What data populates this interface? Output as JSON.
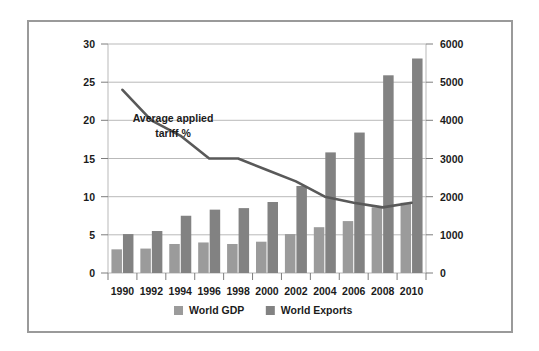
{
  "chart_data": {
    "type": "bar",
    "title": "",
    "subtitle": "",
    "xlabel": "",
    "ylabel": "",
    "categories": [
      "1990",
      "1992",
      "1994",
      "1996",
      "1998",
      "2000",
      "2002",
      "2004",
      "2006",
      "2008",
      "2010"
    ],
    "grid": true,
    "legend_position": "bottom",
    "left_axis": {
      "label": "",
      "ticks": [
        "0",
        "5",
        "10",
        "15",
        "20",
        "25",
        "30"
      ],
      "tick_values": [
        0,
        5,
        10,
        15,
        20,
        25,
        30
      ],
      "ylim": [
        0,
        30
      ]
    },
    "right_axis": {
      "label": "",
      "ticks": [
        "0",
        "1000",
        "2000",
        "3000",
        "4000",
        "5000",
        "6000"
      ],
      "tick_values": [
        0,
        1000,
        2000,
        3000,
        4000,
        5000,
        6000
      ],
      "ylim": [
        0,
        6000
      ]
    },
    "series": [
      {
        "name": "World GDP",
        "type": "bar",
        "axis": "right",
        "color": "#9b9b9b",
        "values_left_scale": [
          3.1,
          3.2,
          3.8,
          4.0,
          3.8,
          4.1,
          5.1,
          6.0,
          6.8,
          8.6,
          9.2
        ],
        "values": [
          620,
          640,
          760,
          800,
          760,
          820,
          1020,
          1200,
          1360,
          1720,
          1840
        ]
      },
      {
        "name": "World Exports",
        "type": "bar",
        "axis": "right",
        "color": "#828282",
        "values_left_scale": [
          5.1,
          5.5,
          7.5,
          8.3,
          8.5,
          9.3,
          11.4,
          15.8,
          18.4,
          25.9,
          28.1
        ],
        "values": [
          1020,
          1100,
          1500,
          1660,
          1700,
          1860,
          2280,
          3160,
          3680,
          5180,
          5620
        ]
      },
      {
        "name": "Average applied tariff %",
        "type": "line",
        "axis": "left",
        "color": "#595959",
        "values": [
          24.0,
          20.0,
          18.0,
          15.0,
          15.0,
          13.5,
          12.0,
          10.0,
          9.2,
          8.6,
          9.2
        ]
      }
    ],
    "annotations": [
      {
        "name": "average-applied-tariff-annotation",
        "line1": "Average applied",
        "line2": "tariff %"
      }
    ]
  },
  "legend": {
    "items": [
      {
        "label": "World GDP",
        "color": "#9b9b9b"
      },
      {
        "label": "World Exports",
        "color": "#828282"
      }
    ]
  },
  "colors": {
    "frame_border": "#9a9a9a",
    "gridline": "#b9b9b9",
    "background": "#ffffff",
    "text": "#1b1b1b"
  }
}
